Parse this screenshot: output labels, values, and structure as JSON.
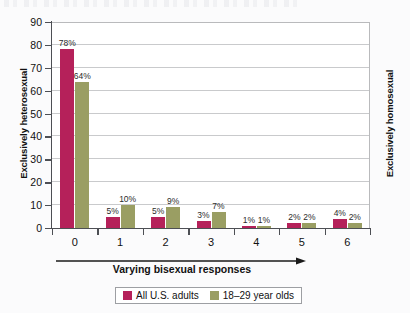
{
  "chart_data": {
    "type": "bar",
    "title": "",
    "subtitle": "",
    "xlabel": "Varying bisexual responses",
    "ylabel_left": "Exclusively heterosexual",
    "ylabel_right": "Exclusively homosexual",
    "categories": [
      "0",
      "1",
      "2",
      "3",
      "4",
      "5",
      "6"
    ],
    "ylim": [
      0,
      90
    ],
    "ytick_labels": [
      "0",
      "10",
      "20",
      "30",
      "40",
      "50",
      "60",
      "70",
      "80",
      "90"
    ],
    "ytick_values": [
      0,
      10,
      20,
      30,
      40,
      50,
      60,
      70,
      80,
      90
    ],
    "grid": "horizontal",
    "legend_position": "bottom",
    "xaxis_arrow": true,
    "series": [
      {
        "name": "All U.S. adults",
        "color": "#b5215a",
        "values": [
          78,
          5,
          5,
          3,
          1,
          2,
          4
        ],
        "labels": [
          "78%",
          "5%",
          "5%",
          "3%",
          "1%",
          "2%",
          "4%"
        ]
      },
      {
        "name": "18–29 year olds",
        "color": "#9a9e63",
        "values": [
          64,
          10,
          9,
          7,
          1,
          2,
          2
        ],
        "labels": [
          "64%",
          "10%",
          "9%",
          "7%",
          "1%",
          "2%",
          "2%"
        ]
      }
    ]
  },
  "legend": {
    "entries": [
      {
        "label": "All U.S. adults",
        "color": "#b5215a"
      },
      {
        "label": "18–29 year olds",
        "color": "#9a9e63"
      }
    ]
  },
  "colors": {
    "adults": "#b5215a",
    "young": "#9a9e63",
    "axis": "#4d4f54",
    "grid": "#c9cacc",
    "background": "#fbfbfc"
  }
}
